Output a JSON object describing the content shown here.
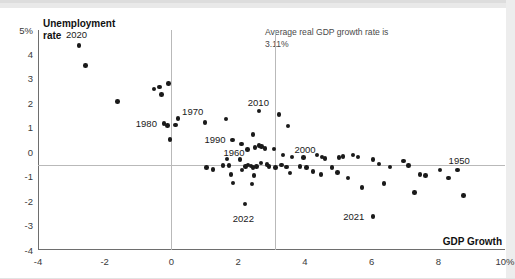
{
  "chart_data": {
    "type": "scatter",
    "title": "",
    "xlabel": "GDP Growth",
    "ylabel": "Unemployment rate",
    "ylabel_line1": "Unemployment",
    "ylabel_line2": "rate",
    "xlim": [
      -4,
      10
    ],
    "ylim": [
      -4,
      5
    ],
    "xticks": [
      "-4",
      "-2",
      "0",
      "2",
      "4",
      "6",
      "8",
      "10%"
    ],
    "xtick_values": [
      -4,
      -2,
      0,
      2,
      4,
      6,
      8,
      10
    ],
    "yticks": [
      "5%",
      "4",
      "3",
      "2",
      "1",
      "0",
      "-1",
      "-2",
      "-3",
      "-4"
    ],
    "ytick_values": [
      5,
      4,
      3,
      2,
      1,
      0,
      -1,
      -2,
      -3,
      -4
    ],
    "grid": "zero-line-and-average-line",
    "legend": "none",
    "reference_lines": [
      {
        "name": "zero-gdp-growth",
        "axis": "x",
        "value": 0
      },
      {
        "name": "average-gdp-growth",
        "axis": "x",
        "value": 3.11
      },
      {
        "name": "zero-unemployment-change",
        "axis": "y",
        "value": 0
      }
    ],
    "annotation": "Average real GDP growth rate is 3.11%",
    "annotation_value": "3.11%",
    "dot_color": "#1a1a1a",
    "points": [
      {
        "x": -2.77,
        "y": 4.37,
        "label": "2020"
      },
      {
        "x": -2.58,
        "y": 3.55,
        "label": ""
      },
      {
        "x": -1.61,
        "y": 2.08,
        "label": ""
      },
      {
        "x": -0.52,
        "y": 2.58,
        "label": ""
      },
      {
        "x": -0.36,
        "y": 2.66,
        "label": ""
      },
      {
        "x": -0.3,
        "y": 2.36,
        "label": ""
      },
      {
        "x": -0.09,
        "y": 2.82,
        "label": ""
      },
      {
        "x": -0.23,
        "y": 1.17,
        "label": "1980"
      },
      {
        "x": -0.12,
        "y": 1.1,
        "label": ""
      },
      {
        "x": 0.12,
        "y": 1.12,
        "label": ""
      },
      {
        "x": 0.2,
        "y": 1.38,
        "label": "1970"
      },
      {
        "x": -0.05,
        "y": 0.52,
        "label": ""
      },
      {
        "x": 1.01,
        "y": 1.22,
        "label": ""
      },
      {
        "x": 1.63,
        "y": 1.35,
        "label": ""
      },
      {
        "x": 1.83,
        "y": 0.5,
        "label": "1990"
      },
      {
        "x": 2.1,
        "y": 0.33,
        "label": ""
      },
      {
        "x": 2.28,
        "y": 0.12,
        "label": "1960"
      },
      {
        "x": 2.44,
        "y": 0.72,
        "label": ""
      },
      {
        "x": 2.5,
        "y": 0.2,
        "label": ""
      },
      {
        "x": 2.63,
        "y": 0.28,
        "label": ""
      },
      {
        "x": 2.7,
        "y": 0.24,
        "label": ""
      },
      {
        "x": 2.62,
        "y": 1.68,
        "label": "2010"
      },
      {
        "x": 2.8,
        "y": 0.16,
        "label": ""
      },
      {
        "x": 3.08,
        "y": 0.13,
        "label": ""
      },
      {
        "x": 3.22,
        "y": 1.55,
        "label": ""
      },
      {
        "x": 3.5,
        "y": 1.08,
        "label": ""
      },
      {
        "x": 3.35,
        "y": -0.12,
        "label": ""
      },
      {
        "x": 3.62,
        "y": -0.19,
        "label": ""
      },
      {
        "x": 3.96,
        "y": -0.22,
        "label": "2000"
      },
      {
        "x": 4.36,
        "y": -0.12,
        "label": ""
      },
      {
        "x": 4.52,
        "y": -0.2,
        "label": ""
      },
      {
        "x": 4.6,
        "y": -0.26,
        "label": ""
      },
      {
        "x": 5.02,
        "y": -0.22,
        "label": ""
      },
      {
        "x": 5.14,
        "y": -0.18,
        "label": ""
      },
      {
        "x": 5.44,
        "y": -0.12,
        "label": ""
      },
      {
        "x": 5.6,
        "y": -0.2,
        "label": ""
      },
      {
        "x": 6.05,
        "y": -0.3,
        "label": ""
      },
      {
        "x": 6.22,
        "y": -0.48,
        "label": ""
      },
      {
        "x": 6.55,
        "y": -0.6,
        "label": ""
      },
      {
        "x": 6.95,
        "y": -0.35,
        "label": ""
      },
      {
        "x": 7.1,
        "y": -0.55,
        "label": ""
      },
      {
        "x": 7.45,
        "y": -0.92,
        "label": ""
      },
      {
        "x": 7.62,
        "y": -0.95,
        "label": ""
      },
      {
        "x": 8.05,
        "y": -0.72,
        "label": ""
      },
      {
        "x": 8.3,
        "y": -1.05,
        "label": ""
      },
      {
        "x": 8.58,
        "y": -0.72,
        "label": "1950"
      },
      {
        "x": 1.55,
        "y": -0.55,
        "label": ""
      },
      {
        "x": 1.05,
        "y": -0.62,
        "label": ""
      },
      {
        "x": 1.25,
        "y": -0.7,
        "label": ""
      },
      {
        "x": 1.66,
        "y": -0.28,
        "label": ""
      },
      {
        "x": 1.72,
        "y": -0.55,
        "label": ""
      },
      {
        "x": 1.78,
        "y": -0.92,
        "label": ""
      },
      {
        "x": 1.85,
        "y": -1.25,
        "label": ""
      },
      {
        "x": 2.05,
        "y": -0.3,
        "label": ""
      },
      {
        "x": 2.12,
        "y": -0.72,
        "label": ""
      },
      {
        "x": 2.22,
        "y": -0.58,
        "label": ""
      },
      {
        "x": 2.3,
        "y": -0.52,
        "label": ""
      },
      {
        "x": 2.38,
        "y": -0.56,
        "label": ""
      },
      {
        "x": 2.45,
        "y": -0.62,
        "label": ""
      },
      {
        "x": 2.55,
        "y": -0.58,
        "label": ""
      },
      {
        "x": 2.48,
        "y": -0.95,
        "label": ""
      },
      {
        "x": 2.42,
        "y": -1.3,
        "label": ""
      },
      {
        "x": 2.68,
        "y": -0.45,
        "label": ""
      },
      {
        "x": 2.86,
        "y": -0.5,
        "label": ""
      },
      {
        "x": 2.92,
        "y": -0.58,
        "label": ""
      },
      {
        "x": 3.12,
        "y": -0.62,
        "label": ""
      },
      {
        "x": 3.3,
        "y": -0.52,
        "label": ""
      },
      {
        "x": 3.45,
        "y": -0.6,
        "label": ""
      },
      {
        "x": 3.55,
        "y": -0.86,
        "label": ""
      },
      {
        "x": 3.85,
        "y": -0.58,
        "label": ""
      },
      {
        "x": 4.05,
        "y": -0.62,
        "label": ""
      },
      {
        "x": 4.25,
        "y": -0.78,
        "label": ""
      },
      {
        "x": 4.48,
        "y": -0.92,
        "label": ""
      },
      {
        "x": 4.82,
        "y": -0.62,
        "label": ""
      },
      {
        "x": 4.98,
        "y": -0.82,
        "label": ""
      },
      {
        "x": 5.3,
        "y": -1.05,
        "label": ""
      },
      {
        "x": 5.72,
        "y": -1.45,
        "label": ""
      },
      {
        "x": 6.38,
        "y": -1.28,
        "label": ""
      },
      {
        "x": 7.28,
        "y": -1.65,
        "label": ""
      },
      {
        "x": 8.75,
        "y": -1.78,
        "label": ""
      },
      {
        "x": 2.2,
        "y": -2.12,
        "label": "2022"
      },
      {
        "x": 6.05,
        "y": -2.62,
        "label": "2021"
      }
    ],
    "annotated_years": [
      "2020",
      "1980",
      "1970",
      "1990",
      "1960",
      "2010",
      "2000",
      "1950",
      "2022",
      "2021"
    ]
  }
}
